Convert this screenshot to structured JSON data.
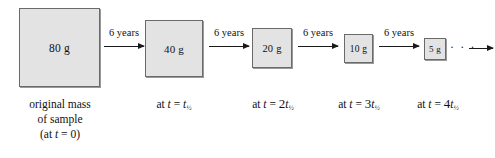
{
  "figure": {
    "type": "half-life-decay-diagram",
    "half_life_years": 6,
    "boxes": [
      {
        "mass_label": "80 g",
        "mass": 80,
        "unit": "g"
      },
      {
        "mass_label": "40 g",
        "mass": 40,
        "unit": "g"
      },
      {
        "mass_label": "20 g",
        "mass": 20,
        "unit": "g"
      },
      {
        "mass_label": "10 g",
        "mass": 10,
        "unit": "g"
      },
      {
        "mass_label": "5 g",
        "mass": 5,
        "unit": "g"
      }
    ],
    "arrows": [
      {
        "label": "6 years"
      },
      {
        "label": "6 years"
      },
      {
        "label": "6 years"
      },
      {
        "label": "6 years"
      }
    ],
    "captions": {
      "first": {
        "line1": "original mass",
        "line2": "of sample",
        "line3_prefix": "(at ",
        "line3_var": "t",
        "line3_suffix": " = 0)"
      },
      "second": {
        "prefix": "at ",
        "var1": "t",
        "eq": " = ",
        "coef": "",
        "var2": "t",
        "sub": "½"
      },
      "third": {
        "prefix": "at ",
        "var1": "t",
        "eq": " = ",
        "coef": "2",
        "var2": "t",
        "sub": "½"
      },
      "fourth": {
        "prefix": "at ",
        "var1": "t",
        "eq": " = ",
        "coef": "3",
        "var2": "t",
        "sub": "½"
      },
      "fifth": {
        "prefix": "at ",
        "var1": "t",
        "eq": " = ",
        "coef": "4",
        "var2": "t",
        "sub": "½"
      }
    },
    "ellipsis": "· · ·",
    "colors": {
      "box_fill": "#e3e3e3",
      "box_border": "#6a6a6a",
      "box_shadow": "#9a9a9a",
      "text": "#111111",
      "arrow": "#1a1a1a",
      "background": "#ffffff"
    }
  }
}
